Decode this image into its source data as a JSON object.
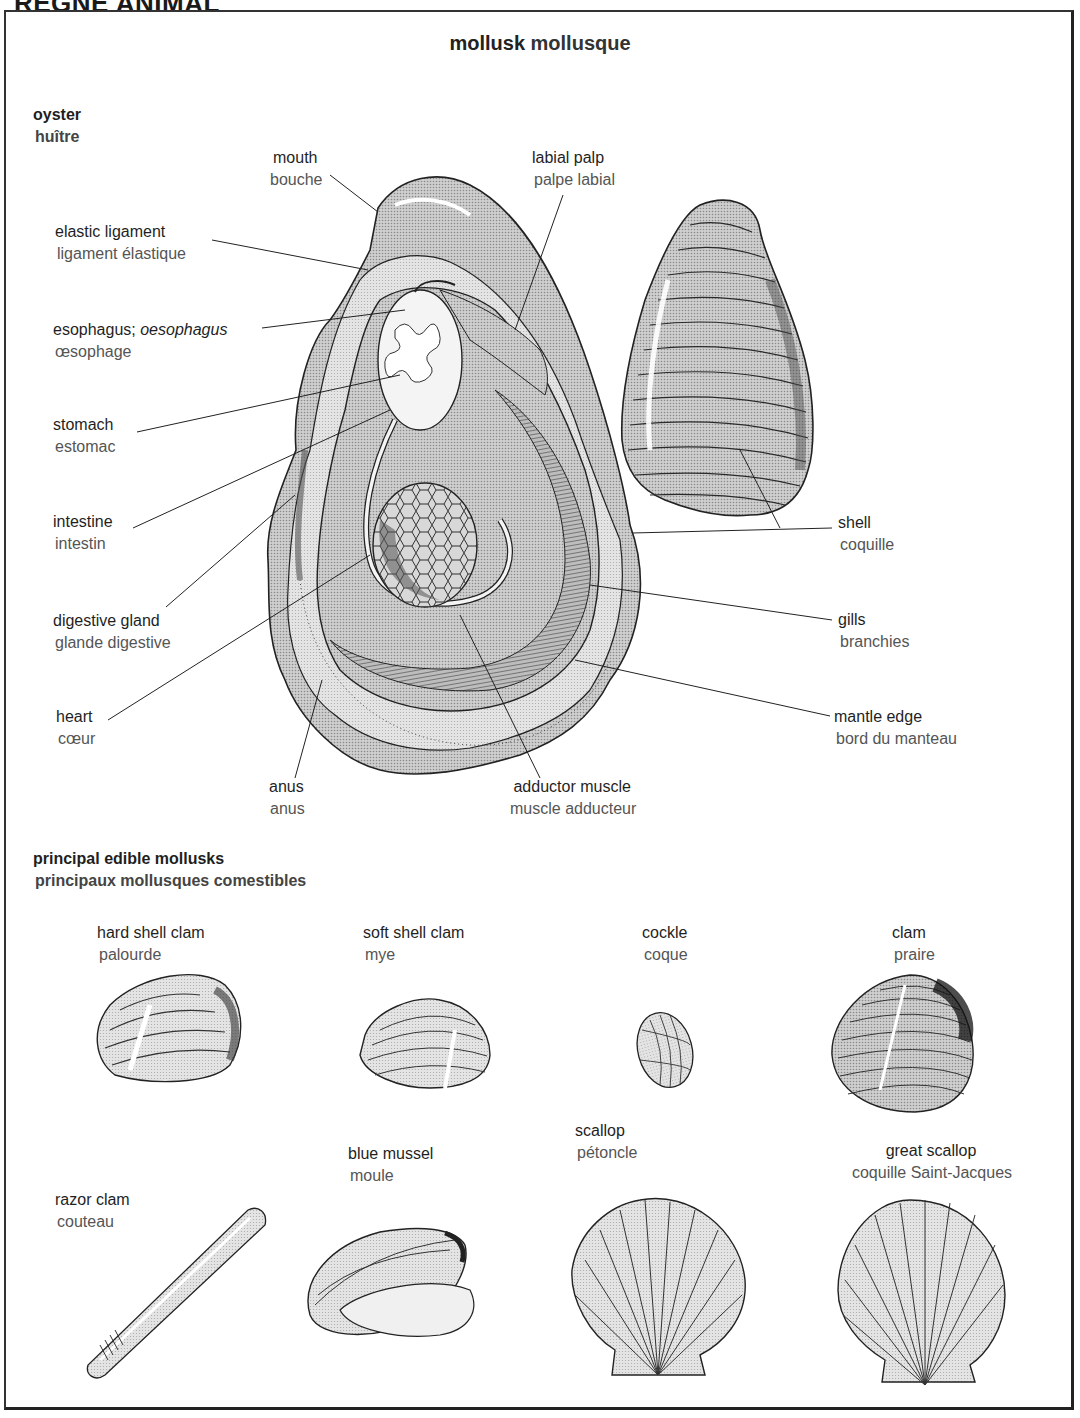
{
  "page_header": "RÈGNE ANIMAL",
  "title": {
    "en": "mollusk",
    "fr": "mollusque"
  },
  "oyster_section": {
    "label": {
      "en": "oyster",
      "fr": "huître"
    },
    "parts": [
      {
        "id": "mouth",
        "en": "mouth",
        "fr": "bouche"
      },
      {
        "id": "labial-palp",
        "en": "labial palp",
        "fr": "palpe labial"
      },
      {
        "id": "elastic-ligament",
        "en": "elastic ligament",
        "fr": "ligament élastique"
      },
      {
        "id": "esophagus",
        "en": "esophagus;",
        "en_alt": "oesophagus",
        "fr": "œsophage"
      },
      {
        "id": "stomach",
        "en": "stomach",
        "fr": "estomac"
      },
      {
        "id": "intestine",
        "en": "intestine",
        "fr": "intestin"
      },
      {
        "id": "digestive-gland",
        "en": "digestive gland",
        "fr": "glande digestive"
      },
      {
        "id": "heart",
        "en": "heart",
        "fr": "cœur"
      },
      {
        "id": "anus",
        "en": "anus",
        "fr": "anus"
      },
      {
        "id": "adductor-muscle",
        "en": "adductor muscle",
        "fr": "muscle adducteur"
      },
      {
        "id": "shell",
        "en": "shell",
        "fr": "coquille"
      },
      {
        "id": "gills",
        "en": "gills",
        "fr": "branchies"
      },
      {
        "id": "mantle-edge",
        "en": "mantle edge",
        "fr": "bord du manteau"
      }
    ]
  },
  "edible_section": {
    "heading": {
      "en": "principal edible mollusks",
      "fr": "principaux mollusques comestibles"
    },
    "items": [
      {
        "id": "hard-shell-clam",
        "en": "hard shell clam",
        "fr": "palourde"
      },
      {
        "id": "soft-shell-clam",
        "en": "soft shell clam",
        "fr": "mye"
      },
      {
        "id": "cockle",
        "en": "cockle",
        "fr": "coque"
      },
      {
        "id": "clam",
        "en": "clam",
        "fr": "praire"
      },
      {
        "id": "razor-clam",
        "en": "razor clam",
        "fr": "couteau"
      },
      {
        "id": "blue-mussel",
        "en": "blue mussel",
        "fr": "moule"
      },
      {
        "id": "scallop",
        "en": "scallop",
        "fr": "pétoncle"
      },
      {
        "id": "great-scallop",
        "en": "great scallop",
        "fr": "coquille Saint-Jacques"
      }
    ]
  },
  "colors": {
    "ink": "#1a1a1a",
    "french_text": "#555555",
    "shell_fill": "#c4c4c4",
    "shell_dark": "#6a6a6a",
    "paper": "#ffffff"
  }
}
